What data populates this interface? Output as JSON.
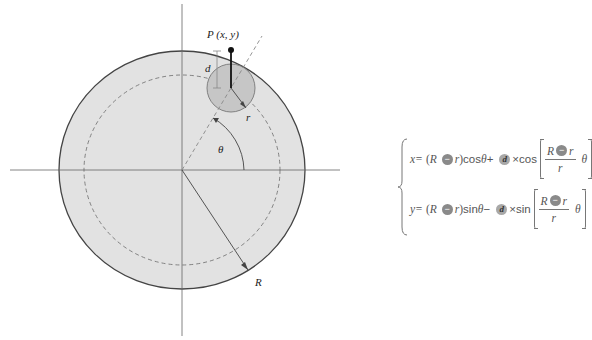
{
  "labels": {
    "point": "P (x, y)",
    "d": "d",
    "r": "r",
    "theta": "θ",
    "R": "R"
  },
  "colors": {
    "big_circle_fill": "#e2e2e2",
    "big_circle_stroke": "#444444",
    "small_circle_fill": "#c6c6c6",
    "axis": "#666666",
    "dashed": "#777777",
    "badge": "#8a8a8a"
  },
  "formula": {
    "x_eq": {
      "lhs": "x=",
      "open": "(",
      "R": "R",
      "minus": "−",
      "r": "r",
      "close": ")",
      "trig": "cos",
      "theta": "θ",
      "op": "+",
      "d": "d",
      "times": "×",
      "trig2": "cos",
      "frac_num_R": "R",
      "frac_num_minus": "−",
      "frac_num_r": "r",
      "frac_den": "r",
      "frac_theta": "θ"
    },
    "y_eq": {
      "lhs": "y=",
      "open": "(",
      "R": "R",
      "minus": "−",
      "r": "r",
      "close": ")",
      "trig": "sin",
      "theta": "θ",
      "op": "−",
      "d": "d",
      "times": "×",
      "trig2": "sin",
      "frac_num_R": "R",
      "frac_num_minus": "−",
      "frac_num_r": "r",
      "frac_den": "r",
      "frac_theta": "θ"
    }
  }
}
